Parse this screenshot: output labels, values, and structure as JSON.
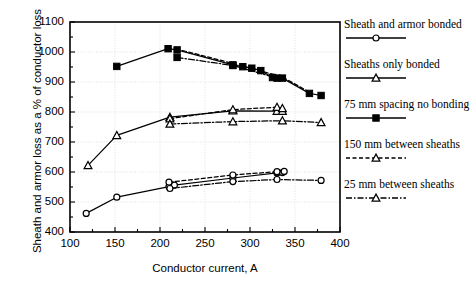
{
  "chart_data": {
    "type": "line",
    "title": "",
    "xlabel": "Conductor current, A",
    "ylabel": "Sheath and armor loss as a % of conductor loss",
    "xlim": [
      100,
      400
    ],
    "ylim": [
      400,
      1100
    ],
    "xticks": [
      "100",
      "150",
      "200",
      "250",
      "300",
      "350",
      "400"
    ],
    "yticks": [
      "400",
      "500",
      "600",
      "700",
      "800",
      "900",
      "1000",
      "1100"
    ],
    "xtick_values": [
      100,
      150,
      200,
      250,
      300,
      350,
      400
    ],
    "ytick_values": [
      400,
      500,
      600,
      700,
      800,
      900,
      1000,
      1100
    ],
    "minor_tick_step_x": 25,
    "minor_tick_step_y": 50,
    "grid": true,
    "legend_position": "right",
    "series": [
      {
        "name": "Sheath and armor bonded",
        "marker": "circle-open",
        "linestyle": "solid",
        "points": [
          {
            "x": 118,
            "y": 462
          },
          {
            "x": 152,
            "y": 516
          },
          {
            "x": 210,
            "y": 551
          },
          {
            "x": 216,
            "y": 556
          },
          {
            "x": 281,
            "y": 580
          },
          {
            "x": 330,
            "y": 597
          },
          {
            "x": 336,
            "y": 598
          }
        ]
      },
      {
        "name": "Sheaths only bonded",
        "marker": "triangle-open",
        "linestyle": "solid",
        "points": [
          {
            "x": 120,
            "y": 622
          },
          {
            "x": 152,
            "y": 722
          },
          {
            "x": 211,
            "y": 783
          },
          {
            "x": 281,
            "y": 804
          },
          {
            "x": 330,
            "y": 803
          },
          {
            "x": 336,
            "y": 803
          }
        ]
      },
      {
        "name": "75 mm spacing no bonding",
        "marker": "square-filled",
        "linestyle": "solid",
        "points": [
          {
            "x": 152,
            "y": 952
          },
          {
            "x": 209,
            "y": 1011
          },
          {
            "x": 219,
            "y": 1007
          },
          {
            "x": 281,
            "y": 957
          },
          {
            "x": 292,
            "y": 951
          },
          {
            "x": 302,
            "y": 946
          },
          {
            "x": 312,
            "y": 938
          },
          {
            "x": 325,
            "y": 915
          },
          {
            "x": 336,
            "y": 913
          },
          {
            "x": 366,
            "y": 862
          },
          {
            "x": 379,
            "y": 855
          }
        ]
      },
      {
        "name": "150 mm between sheaths",
        "marker": "triangle-open",
        "linestyle": "dashed",
        "points": [
          {
            "x": 211,
            "y": 778
          },
          {
            "x": 281,
            "y": 808
          },
          {
            "x": 330,
            "y": 816
          },
          {
            "x": 336,
            "y": 812
          }
        ]
      },
      {
        "name": "25 mm between sheaths",
        "marker": "triangle-open",
        "linestyle": "dashdot",
        "points": [
          {
            "x": 211,
            "y": 760
          },
          {
            "x": 281,
            "y": 768
          },
          {
            "x": 336,
            "y": 771
          },
          {
            "x": 379,
            "y": 765
          }
        ]
      },
      {
        "name": "150 mm between sheaths (circles)",
        "marker": "circle-open",
        "linestyle": "dashed",
        "points": [
          {
            "x": 210,
            "y": 566
          },
          {
            "x": 281,
            "y": 590
          },
          {
            "x": 330,
            "y": 601
          },
          {
            "x": 338,
            "y": 602
          }
        ]
      },
      {
        "name": "25 mm between sheaths (circles)",
        "marker": "circle-open",
        "linestyle": "dashdot",
        "points": [
          {
            "x": 211,
            "y": 545
          },
          {
            "x": 281,
            "y": 568
          },
          {
            "x": 330,
            "y": 575
          },
          {
            "x": 379,
            "y": 572
          }
        ]
      },
      {
        "name": "75 mm spacing no bonding (dashdot)",
        "marker": "square-filled",
        "linestyle": "dashdot",
        "points": [
          {
            "x": 219,
            "y": 982
          },
          {
            "x": 281,
            "y": 955
          },
          {
            "x": 330,
            "y": 913
          }
        ]
      },
      {
        "name": "75 mm spacing no bonding (dashed)",
        "marker": "none",
        "linestyle": "dashed",
        "points": [
          {
            "x": 225,
            "y": 1005
          },
          {
            "x": 281,
            "y": 962
          },
          {
            "x": 336,
            "y": 917
          },
          {
            "x": 366,
            "y": 866
          }
        ]
      }
    ]
  },
  "legend": {
    "entries": [
      {
        "label": "Sheath and armor bonded",
        "marker": "circle-open",
        "linestyle": "solid"
      },
      {
        "label": "Sheaths only bonded",
        "marker": "triangle-open",
        "linestyle": "solid"
      },
      {
        "label": "75 mm spacing no bonding",
        "marker": "square-filled",
        "linestyle": "solid"
      },
      {
        "label": "150 mm between sheaths",
        "marker": "triangle-open",
        "linestyle": "dashed"
      },
      {
        "label": "25 mm between sheaths",
        "marker": "triangle-open",
        "linestyle": "dashdot"
      }
    ]
  },
  "colors": {
    "ink": "#000000",
    "grid": "#cccccc",
    "background": "#ffffff"
  }
}
